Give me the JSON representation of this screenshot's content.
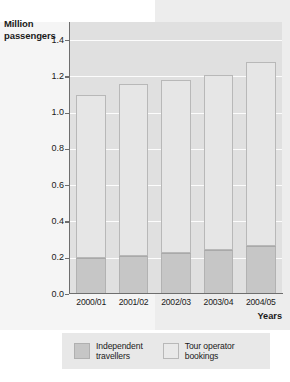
{
  "chart_data": {
    "type": "bar",
    "subtype": "stacked-bar",
    "title": "",
    "xlabel": "Years",
    "ylabel": "Million passengers",
    "categories": [
      "2000/01",
      "2001/02",
      "2002/03",
      "2003/04",
      "2004/05"
    ],
    "series": [
      {
        "name": "Independent travellers",
        "color": "#c6c6c6",
        "values": [
          0.2,
          0.21,
          0.225,
          0.245,
          0.265
        ]
      },
      {
        "name": "Tour operator bookings",
        "color": "#e6e6e6",
        "values": [
          0.9,
          0.95,
          0.955,
          0.965,
          1.015
        ]
      }
    ],
    "totals": [
      1.1,
      1.16,
      1.18,
      1.21,
      1.28
    ],
    "ylim": [
      0.0,
      1.5
    ],
    "ytick_values": [
      0.0,
      0.2,
      0.4,
      0.6,
      0.8,
      1.0,
      1.2,
      1.4
    ],
    "ytick_labels": [
      "0.0",
      "0.2",
      "0.4",
      "0.6",
      "0.8",
      "1.0",
      "1.2",
      "1.4"
    ],
    "grid": true,
    "grid_axis": "y",
    "legend_position": "bottom"
  },
  "axis": {
    "y_title_line1": "Million",
    "y_title_line2": "passengers",
    "x_title": "Years"
  },
  "legend": {
    "items": [
      {
        "label_line1": "Independent",
        "label_line2": "travellers"
      },
      {
        "label_line1": "Tour operator",
        "label_line2": "bookings"
      }
    ]
  },
  "colors": {
    "independent": "#c6c6c6",
    "tour_operator": "#e6e6e6",
    "plot_background": "#e0e0e0",
    "gridline": "#fcfcfc",
    "axis": "#6e6e6e",
    "legend_background": "#e8e8e8",
    "text": "#1a1a1a"
  }
}
